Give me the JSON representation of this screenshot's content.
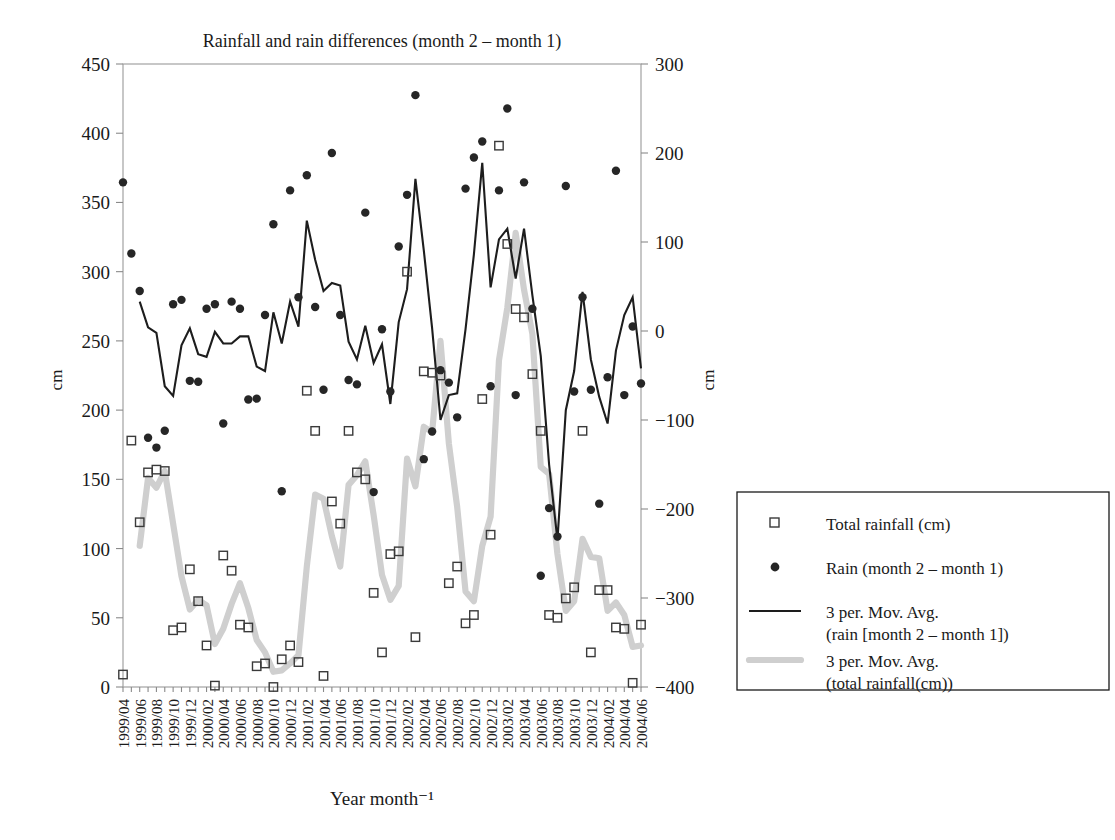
{
  "chart_data": {
    "type": "scatter",
    "title": "Rainfall and rain differences (month 2 – month 1)",
    "xlabel": "Year month⁻¹",
    "ylabel": "cm",
    "ylabel_right": "cm",
    "ylim": [
      0,
      450
    ],
    "ylim_right": [
      -400,
      300
    ],
    "yticks": [
      0,
      50,
      100,
      150,
      200,
      250,
      300,
      350,
      400,
      450
    ],
    "yticks_right": [
      -400,
      -300,
      -200,
      -100,
      0,
      100,
      200,
      300
    ],
    "grid": false,
    "legend_position": "right-outside",
    "x": [
      "1999/04",
      "1999/05",
      "1999/06",
      "1999/07",
      "1999/08",
      "1999/09",
      "1999/10",
      "1999/11",
      "1999/12",
      "2000/01",
      "2000/02",
      "2000/03",
      "2000/04",
      "2000/05",
      "2000/06",
      "2000/07",
      "2000/08",
      "2000/09",
      "2000/10",
      "2000/11",
      "2000/12",
      "2001/01",
      "2001/02",
      "2001/03",
      "2001/04",
      "2001/05",
      "2001/06",
      "2001/07",
      "2001/08",
      "2001/09",
      "2001/10",
      "2001/11",
      "2001/12",
      "2002/01",
      "2002/02",
      "2002/03",
      "2002/04",
      "2002/05",
      "2002/06",
      "2002/07",
      "2002/08",
      "2002/09",
      "2002/10",
      "2002/11",
      "2002/12",
      "2003/01",
      "2003/02",
      "2003/03",
      "2003/04",
      "2003/05",
      "2003/06",
      "2003/07",
      "2003/08",
      "2003/09",
      "2003/10",
      "2003/11",
      "2003/12",
      "2004/01",
      "2004/02",
      "2004/03",
      "2004/04",
      "2004/05",
      "2004/06"
    ],
    "xtick_labels": [
      "1999/04",
      "1999/06",
      "1999/08",
      "1999/10",
      "1999/12",
      "2000/02",
      "2000/04",
      "2000/06",
      "2000/08",
      "2000/10",
      "2000/12",
      "2001/02",
      "2001/04",
      "2001/06",
      "2001/08",
      "2001/10",
      "2001/12",
      "2002/02",
      "2002/04",
      "2002/06",
      "2002/08",
      "2002/10",
      "2002/12",
      "2003/02",
      "2003/04",
      "2003/06",
      "2003/08",
      "2003/10",
      "2003/12",
      "2004/02",
      "2004/04",
      "2004/06"
    ],
    "series": [
      {
        "name": "Total rainfall (cm)",
        "axis": "left",
        "marker": "open-square",
        "values": [
          9,
          178,
          119,
          155,
          157,
          156,
          41,
          43,
          85,
          62,
          30,
          1,
          95,
          84,
          45,
          43,
          15,
          17,
          0,
          20,
          30,
          18,
          214,
          185,
          8,
          134,
          118,
          185,
          155,
          150,
          68,
          25,
          96,
          98,
          300,
          36,
          228,
          227,
          225,
          75,
          87,
          46,
          52,
          208,
          110,
          391,
          320,
          273,
          267,
          226,
          185,
          52,
          50,
          64,
          72,
          185,
          25,
          70,
          70,
          43,
          42,
          3,
          45
        ]
      },
      {
        "name": "Rain (month 2 – month 1)",
        "axis": "right",
        "marker": "filled-circle",
        "values": [
          167,
          87,
          45,
          -120,
          -131,
          -112,
          30,
          35,
          -56,
          -57,
          25,
          30,
          -104,
          33,
          25,
          -77,
          -76,
          18,
          120,
          -180,
          158,
          38,
          175,
          27,
          -66,
          200,
          18,
          -55,
          -60,
          133,
          -181,
          2,
          -68,
          95,
          153,
          265,
          -144,
          -113,
          -44,
          -58,
          -97,
          160,
          195,
          213,
          -62,
          158,
          250,
          -72,
          167,
          25,
          -275,
          -199,
          -231,
          163,
          -68,
          38,
          -66,
          -194,
          -52,
          180,
          -72,
          5,
          -59
        ]
      },
      {
        "name": "3 per. Mov. Avg. (rain [month 2 – month 1])",
        "axis": "right",
        "style": "solid-black-line",
        "values": [
          null,
          null,
          33,
          4,
          -2,
          -62,
          -73,
          -16,
          3,
          -26,
          -29,
          -1,
          -14,
          -14,
          -6,
          -6,
          -40,
          -45,
          21,
          -14,
          33,
          5,
          124,
          80,
          45,
          54,
          51,
          -12,
          -32,
          6,
          -36,
          -15,
          -82,
          10,
          47,
          171,
          91,
          3,
          -100,
          -72,
          -70,
          2,
          86,
          189,
          49,
          103,
          115,
          59,
          115,
          40,
          -28,
          -150,
          -235,
          -89,
          -45,
          44,
          -32,
          -74,
          -104,
          -22,
          18,
          38,
          -42
        ]
      },
      {
        "name": "3 per. Mov. Avg. (total rainfall(cm))",
        "axis": "left",
        "style": "thick-gray-line",
        "values": [
          null,
          null,
          102,
          151,
          144,
          156,
          118,
          80,
          56,
          63,
          59,
          31,
          42,
          60,
          75,
          57,
          34,
          25,
          11,
          12,
          17,
          23,
          87,
          139,
          136,
          109,
          87,
          146,
          153,
          163,
          124,
          81,
          63,
          73,
          165,
          145,
          188,
          184,
          250,
          176,
          130,
          69,
          62,
          102,
          123,
          236,
          274,
          328,
          287,
          255,
          159,
          154,
          96,
          55,
          62,
          107,
          94,
          93,
          55,
          61,
          52,
          29,
          30
        ]
      }
    ],
    "legend": [
      {
        "label": "Total rainfall (cm)",
        "marker": "open-square"
      },
      {
        "label": "Rain (month 2 – month 1)",
        "marker": "filled-circle"
      },
      {
        "label": "3 per. Mov. Avg.",
        "label2": "(rain [month 2 – month 1])",
        "marker": "solid-black-line"
      },
      {
        "label": "3 per. Mov. Avg.",
        "label2": "(total rainfall(cm))",
        "marker": "thick-gray-line"
      }
    ],
    "colors": {
      "rain_marker": "#262626",
      "total_marker": "#3a3a3a",
      "mov_avg_rain": "#1d1d1d",
      "mov_avg_total": "#cfcfcf",
      "axis": "#8a8a8a"
    }
  }
}
